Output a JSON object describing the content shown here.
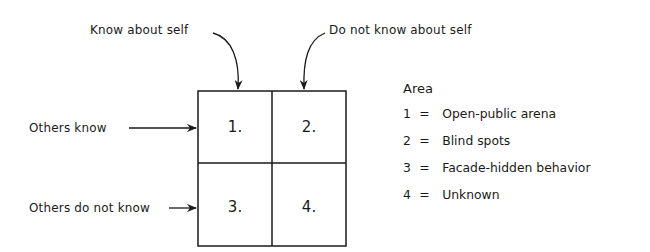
{
  "diagram": {
    "column_labels": [
      "Know about self",
      "Do not know about self"
    ],
    "row_labels": [
      "Others know",
      "Others do not know"
    ],
    "cells": [
      {
        "id": 1,
        "label": "1."
      },
      {
        "id": 2,
        "label": "2."
      },
      {
        "id": 3,
        "label": "3."
      },
      {
        "id": 4,
        "label": "4."
      }
    ],
    "legend": {
      "title": "Area",
      "items": [
        {
          "key": "1",
          "sep": "=",
          "text": "Open-public arena"
        },
        {
          "key": "2",
          "sep": "=",
          "text": "Blind spots"
        },
        {
          "key": "3",
          "sep": "=",
          "text": "Facade-hidden behavior"
        },
        {
          "key": "4",
          "sep": "=",
          "text": "Unknown"
        }
      ]
    },
    "colors": {
      "ink": "#1a1a1a",
      "background": "#ffffff"
    }
  }
}
